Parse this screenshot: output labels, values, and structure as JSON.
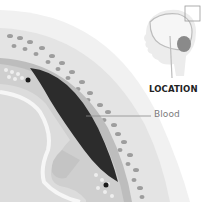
{
  "diagram": {
    "labels": {
      "blood": "Blood",
      "location": "LOCATION"
    },
    "inset": {
      "description": "Sagittal head/brain silhouette with highlighted region box",
      "highlight_box": true
    },
    "colors": {
      "background": "#ffffff",
      "skin_layer": "#ececec",
      "bone_layer": "#e2e2e2",
      "bone_pores": "#9a9a9a",
      "dura_layer": "#b8b8b8",
      "blood_clot": "#2b2b2b",
      "brain_tissue": "#d8d8d8",
      "sulcus": "#f2f2f2",
      "leader_line": "#8a8a8a",
      "label_text": "#7a7a7a",
      "location_text": "#222222"
    }
  }
}
